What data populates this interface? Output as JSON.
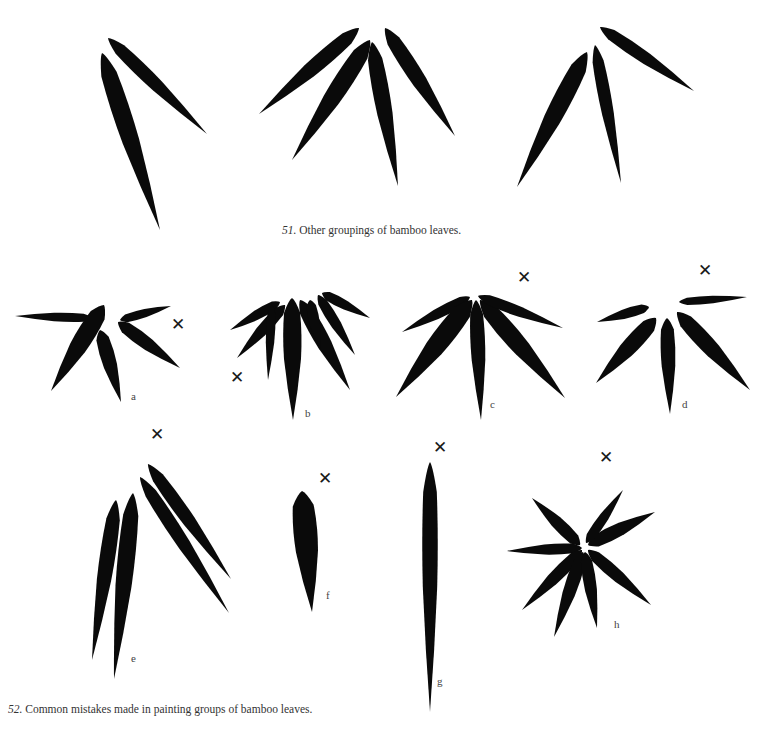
{
  "page": {
    "background": "#ffffff",
    "ink_color": "#0a0a0a"
  },
  "figure51": {
    "number": "51.",
    "caption": "Other groupings of bamboo leaves.",
    "caption_pos": [
      282,
      233
    ],
    "groups": [
      {
        "id": "51-left",
        "leaves": [
          {
            "b": [
              108,
              38
            ],
            "t": [
              207,
              134
            ],
            "w": 15
          },
          {
            "b": [
              102,
              53
            ],
            "t": [
              160,
              230
            ],
            "w": 20
          }
        ]
      },
      {
        "id": "51-middle",
        "leaves": [
          {
            "b": [
              359,
              28
            ],
            "t": [
              259,
              114
            ],
            "w": 17
          },
          {
            "b": [
              370,
              40
            ],
            "t": [
              292,
              160
            ],
            "w": 20
          },
          {
            "b": [
              372,
              42
            ],
            "t": [
              398,
              186
            ],
            "w": 18
          },
          {
            "b": [
              385,
              28
            ],
            "t": [
              455,
              136
            ],
            "w": 17
          }
        ]
      },
      {
        "id": "51-right",
        "leaves": [
          {
            "b": [
              600,
              27
            ],
            "t": [
              694,
              91
            ],
            "w": 14
          },
          {
            "b": [
              587,
              52
            ],
            "t": [
              517,
              187
            ],
            "w": 20
          },
          {
            "b": [
              595,
              45
            ],
            "t": [
              621,
              183
            ],
            "w": 14
          }
        ]
      }
    ]
  },
  "figure52": {
    "number": "52.",
    "caption": "Common mistakes made in painting groups of bamboo leaves.",
    "caption_pos": [
      8,
      712
    ],
    "mistake_mark": "✕",
    "examples": [
      {
        "label": "a",
        "label_pos": [
          131,
          398
        ],
        "mark_pos": [
          177,
          325
        ],
        "leaves": [
          {
            "b": [
              93,
              318
            ],
            "t": [
              15,
              316
            ],
            "w": 10
          },
          {
            "b": [
              104,
              305
            ],
            "t": [
              51,
              391
            ],
            "w": 20
          },
          {
            "b": [
              100,
              330
            ],
            "t": [
              121,
              402
            ],
            "w": 16
          },
          {
            "b": [
              120,
              320
            ],
            "t": [
              171,
              306
            ],
            "w": 10
          },
          {
            "b": [
              118,
              322
            ],
            "t": [
              180,
              368
            ],
            "w": 15
          }
        ]
      },
      {
        "label": "b",
        "label_pos": [
          305,
          415
        ],
        "mark_pos": [
          236,
          378
        ],
        "leaves": [
          {
            "b": [
              280,
              302
            ],
            "t": [
              230,
              330
            ],
            "w": 11
          },
          {
            "b": [
              285,
              305
            ],
            "t": [
              237,
              358
            ],
            "w": 13
          },
          {
            "b": [
              272,
              305
            ],
            "t": [
              268,
              380
            ],
            "w": 10
          },
          {
            "b": [
              292,
              298
            ],
            "t": [
              293,
              420
            ],
            "w": 20
          },
          {
            "b": [
              300,
              300
            ],
            "t": [
              350,
              390
            ],
            "w": 17
          },
          {
            "b": [
              310,
              300
            ],
            "t": [
              320,
              350
            ],
            "w": 12
          },
          {
            "b": [
              322,
              293
            ],
            "t": [
              370,
              318
            ],
            "w": 11
          },
          {
            "b": [
              318,
              295
            ],
            "t": [
              355,
              355
            ],
            "w": 12
          }
        ]
      },
      {
        "label": "c",
        "label_pos": [
          490,
          406
        ],
        "mark_pos": [
          523,
          278
        ],
        "leaves": [
          {
            "b": [
              470,
              297
            ],
            "t": [
              402,
              332
            ],
            "w": 12
          },
          {
            "b": [
              472,
              300
            ],
            "t": [
              396,
              397
            ],
            "w": 22
          },
          {
            "b": [
              476,
              300
            ],
            "t": [
              481,
              420
            ],
            "w": 16
          },
          {
            "b": [
              480,
              300
            ],
            "t": [
              565,
              398
            ],
            "w": 20
          },
          {
            "b": [
              478,
              296
            ],
            "t": [
              563,
              328
            ],
            "w": 12
          }
        ]
      },
      {
        "label": "d",
        "label_pos": [
          682,
          406
        ],
        "mark_pos": [
          704,
          271
        ],
        "leaves": [
          {
            "b": [
              649,
              307
            ],
            "t": [
              597,
              322
            ],
            "w": 11
          },
          {
            "b": [
              656,
              318
            ],
            "t": [
              596,
              383
            ],
            "w": 18
          },
          {
            "b": [
              667,
              318
            ],
            "t": [
              670,
              414
            ],
            "w": 16
          },
          {
            "b": [
              677,
              312
            ],
            "t": [
              750,
              390
            ],
            "w": 18
          },
          {
            "b": [
              679,
              302
            ],
            "t": [
              747,
              297
            ],
            "w": 9
          }
        ]
      },
      {
        "label": "e",
        "label_pos": [
          131,
          660
        ],
        "mark_pos": [
          156,
          435
        ],
        "leaves": [
          {
            "b": [
              116,
              500
            ],
            "t": [
              92,
              660
            ],
            "w": 17
          },
          {
            "b": [
              133,
              493
            ],
            "t": [
              114,
              679
            ],
            "w": 19
          },
          {
            "b": [
              140,
              477
            ],
            "t": [
              229,
              613
            ],
            "w": 15
          },
          {
            "b": [
              148,
              464
            ],
            "t": [
              231,
              579
            ],
            "w": 15
          }
        ]
      },
      {
        "label": "f",
        "label_pos": [
          326,
          597
        ],
        "mark_pos": [
          324,
          479
        ],
        "leaves": [
          {
            "b": [
              302,
              491
            ],
            "t": [
              312,
              612
            ],
            "w": 26
          }
        ]
      },
      {
        "label": "g",
        "label_pos": [
          437,
          683
        ],
        "mark_pos": [
          439,
          448
        ],
        "leaves": [
          {
            "b": [
              430,
              462
            ],
            "t": [
              430,
              712
            ],
            "w": 17
          }
        ]
      },
      {
        "label": "h",
        "label_pos": [
          614,
          626
        ],
        "mark_pos": [
          605,
          458
        ],
        "leaves": [
          {
            "b": [
              580,
              545
            ],
            "t": [
              532,
              498
            ],
            "w": 14
          },
          {
            "b": [
              582,
              548
            ],
            "t": [
              507,
              551
            ],
            "w": 12
          },
          {
            "b": [
              582,
              550
            ],
            "t": [
              522,
              610
            ],
            "w": 14
          },
          {
            "b": [
              583,
              552
            ],
            "t": [
              554,
              637
            ],
            "w": 15
          },
          {
            "b": [
              585,
              552
            ],
            "t": [
              597,
              628
            ],
            "w": 14
          },
          {
            "b": [
              588,
              550
            ],
            "t": [
              651,
              605
            ],
            "w": 14
          },
          {
            "b": [
              588,
              545
            ],
            "t": [
              655,
              512
            ],
            "w": 15
          },
          {
            "b": [
              586,
              543
            ],
            "t": [
              623,
              490
            ],
            "w": 11
          }
        ]
      }
    ]
  }
}
